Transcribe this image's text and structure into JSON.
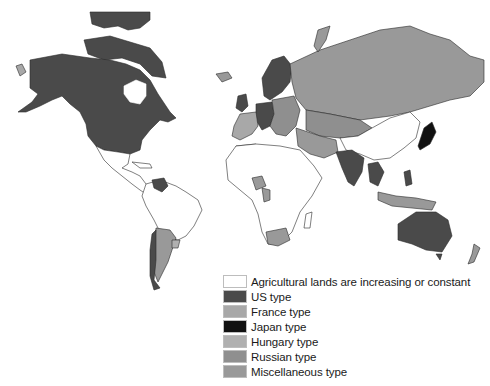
{
  "map": {
    "title": "World map of agricultural land change types",
    "colors": {
      "increasing": "#ffffff",
      "us": "#4a4a4a",
      "france": "#a8a8a8",
      "japan": "#111111",
      "hungary": "#b0b0b0",
      "russian": "#8f8f8f",
      "misc": "#999999",
      "border": "#2a2a2a"
    },
    "regions": [
      {
        "name": "north-america",
        "type": "us"
      },
      {
        "name": "alaska",
        "type": "us"
      },
      {
        "name": "greenland-arctic-islands",
        "type": "us"
      },
      {
        "name": "central-america-mexico",
        "type": "increasing"
      },
      {
        "name": "venezuela",
        "type": "us"
      },
      {
        "name": "south-america-north",
        "type": "increasing"
      },
      {
        "name": "argentina",
        "type": "misc"
      },
      {
        "name": "chile",
        "type": "us"
      },
      {
        "name": "uruguay",
        "type": "hungary"
      },
      {
        "name": "western-europe",
        "type": "us"
      },
      {
        "name": "scandinavia",
        "type": "us"
      },
      {
        "name": "france-iberia",
        "type": "france"
      },
      {
        "name": "eastern-europe",
        "type": "russian"
      },
      {
        "name": "russia",
        "type": "misc"
      },
      {
        "name": "central-asia",
        "type": "russian"
      },
      {
        "name": "iran-middle-east",
        "type": "misc"
      },
      {
        "name": "north-africa",
        "type": "misc"
      },
      {
        "name": "africa",
        "type": "increasing"
      },
      {
        "name": "nigeria",
        "type": "misc"
      },
      {
        "name": "south-africa",
        "type": "misc"
      },
      {
        "name": "india",
        "type": "us"
      },
      {
        "name": "china",
        "type": "increasing"
      },
      {
        "name": "japan",
        "type": "japan"
      },
      {
        "name": "southeast-asia",
        "type": "us"
      },
      {
        "name": "indonesia",
        "type": "misc"
      },
      {
        "name": "australia",
        "type": "us"
      },
      {
        "name": "new-zealand",
        "type": "misc"
      },
      {
        "name": "iceland",
        "type": "misc"
      }
    ]
  },
  "legend": {
    "items": [
      {
        "key": "increasing",
        "label": "Agricultural lands are increasing or constant",
        "color": "#ffffff"
      },
      {
        "key": "us",
        "label": "US type",
        "color": "#4a4a4a"
      },
      {
        "key": "france",
        "label": "France type",
        "color": "#a8a8a8"
      },
      {
        "key": "japan",
        "label": "Japan type",
        "color": "#111111"
      },
      {
        "key": "hungary",
        "label": "Hungary type",
        "color": "#b0b0b0"
      },
      {
        "key": "russian",
        "label": "Russian type",
        "color": "#8f8f8f"
      },
      {
        "key": "misc",
        "label": "Miscellaneous type",
        "color": "#999999"
      }
    ]
  }
}
